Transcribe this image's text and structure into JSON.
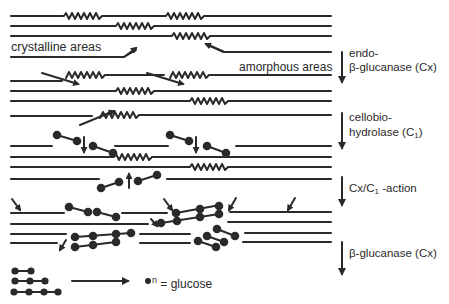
{
  "figure": {
    "labels": {
      "crystalline": "crystalline areas",
      "amorphous": "amorphous areas",
      "endo_line1": "endo-",
      "endo_line2": "β-glucanase (Cx)",
      "cbh_line1": "cellobio-",
      "cbh_line2_main": "hydrolase (C",
      "cbh_line2_sub": "1",
      "cbh_line2_end": ")",
      "cxc1_main": "Cx/C",
      "cxc1_sub": "1",
      "cxc1_end": " -action",
      "bgluc": "β-glucanase (Cx)",
      "legend_sup": "n",
      "legend_text": " = glucose"
    },
    "stages": [
      {
        "name": "native cellulose",
        "regions": [
          "crystalline areas",
          "amorphous areas"
        ]
      },
      {
        "name": "endo-β-glucanase (Cx)"
      },
      {
        "name": "cellobiohydrolase (C1)"
      },
      {
        "name": "Cx/C1 -action"
      },
      {
        "name": "β-glucanase (Cx)"
      }
    ],
    "legend": {
      "symbol": "glucose unit (filled circle)",
      "products": [
        "cellobiose",
        "cellotriose",
        "cellotetraose"
      ],
      "result": "glucose"
    },
    "colors": {
      "ink": "#2a2a2a",
      "background": "#ffffff"
    }
  }
}
